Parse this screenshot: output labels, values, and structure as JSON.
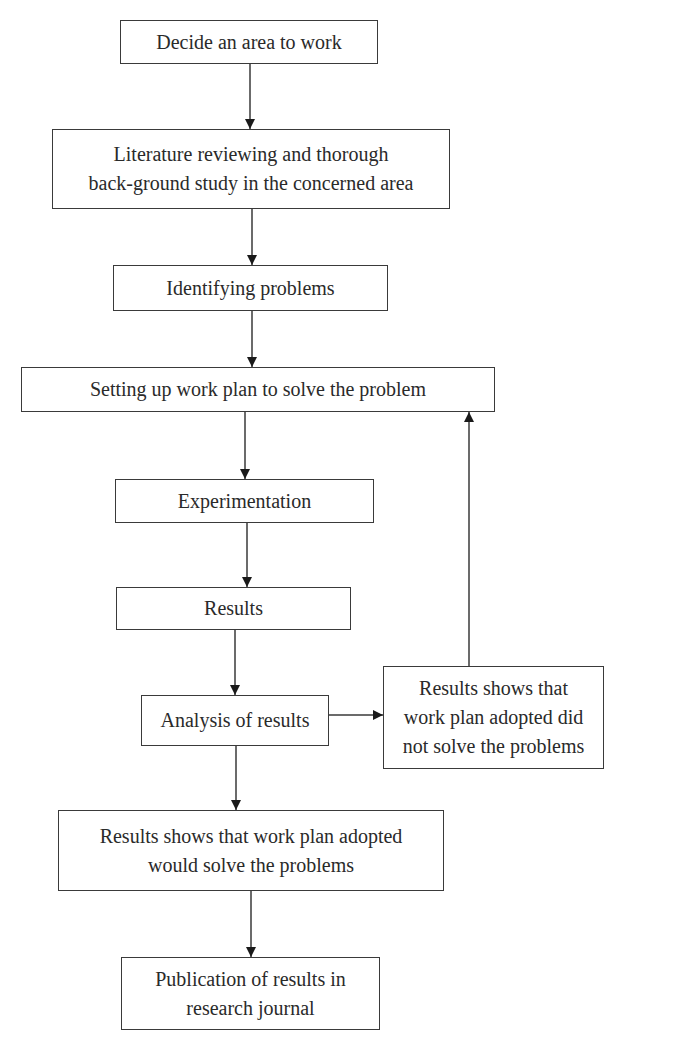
{
  "diagram": {
    "type": "flowchart",
    "nodes": [
      {
        "id": "n1",
        "lines": [
          "Decide an area to work"
        ]
      },
      {
        "id": "n2",
        "lines": [
          "Literature reviewing and thorough",
          "back-ground study in the concerned area"
        ]
      },
      {
        "id": "n3",
        "lines": [
          "Identifying problems"
        ]
      },
      {
        "id": "n4",
        "lines": [
          "Setting up work plan to solve the problem"
        ]
      },
      {
        "id": "n5",
        "lines": [
          "Experimentation"
        ]
      },
      {
        "id": "n6",
        "lines": [
          "Results"
        ]
      },
      {
        "id": "n7",
        "lines": [
          "Analysis of results"
        ]
      },
      {
        "id": "n8",
        "lines": [
          "Results shows that",
          "work plan adopted did",
          "not solve the problems"
        ]
      },
      {
        "id": "n9",
        "lines": [
          "Results shows that work plan adopted",
          "would solve the problems"
        ]
      },
      {
        "id": "n10",
        "lines": [
          "Publication of results in",
          "research journal"
        ]
      }
    ],
    "edges": [
      {
        "from": "n1",
        "to": "n2"
      },
      {
        "from": "n2",
        "to": "n3"
      },
      {
        "from": "n3",
        "to": "n4"
      },
      {
        "from": "n4",
        "to": "n5"
      },
      {
        "from": "n5",
        "to": "n6"
      },
      {
        "from": "n6",
        "to": "n7"
      },
      {
        "from": "n7",
        "to": "n8"
      },
      {
        "from": "n8",
        "to": "n4"
      },
      {
        "from": "n7",
        "to": "n9"
      },
      {
        "from": "n9",
        "to": "n10"
      }
    ],
    "colors": {
      "stroke": "#3a3a3a",
      "text": "#2a2a2a",
      "background": "#ffffff"
    }
  }
}
